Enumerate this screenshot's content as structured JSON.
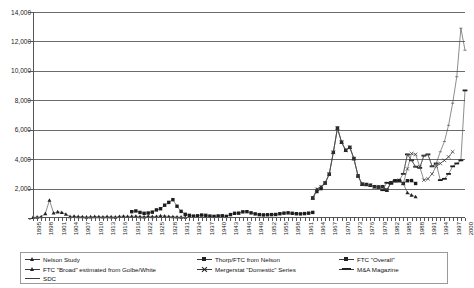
{
  "chart_data": {
    "type": "line",
    "title": "",
    "xlabel": "",
    "ylabel": "",
    "ylim": [
      0,
      14000
    ],
    "ytick_step": 2000,
    "ytick_labels": [
      "14,000",
      "12,000",
      "10,000",
      "8,000",
      "6,000",
      "4,000",
      "2,000",
      "-"
    ],
    "ytick_values": [
      14000,
      12000,
      10000,
      8000,
      6000,
      4000,
      2000,
      0
    ],
    "grid": "horizontal",
    "legend_position": "bottom",
    "x_start": 1895,
    "x_end": 2000,
    "x_label_step": 3,
    "xtick_labels": [
      "1895",
      "1898",
      "1901",
      "1904",
      "1907",
      "1910",
      "1913",
      "1916",
      "1919",
      "1922",
      "1925",
      "1928",
      "1931",
      "1934",
      "1937",
      "1940",
      "1943",
      "1946",
      "1949",
      "1952",
      "1955",
      "1958",
      "1961",
      "1964",
      "1967",
      "1970",
      "1973",
      "1976",
      "1979",
      "1982",
      "1985",
      "1988",
      "1991",
      "1994",
      "1997",
      "2000"
    ],
    "series": [
      {
        "name": "Nelson Study",
        "marker": "triangle",
        "x_start": 1895,
        "values": [
          40,
          60,
          90,
          300,
          1210,
          340,
          420,
          380,
          260,
          100,
          120,
          95,
          90,
          60,
          80,
          100,
          90,
          75,
          95,
          80,
          60,
          110,
          125,
          105,
          115,
          120,
          95,
          80,
          120,
          100,
          110,
          150,
          130,
          110,
          90,
          70,
          60,
          50
        ]
      },
      {
        "name": "Thorp/FTC from Nelson",
        "marker": "square",
        "x_start": 1919,
        "values": [
          430,
          480,
          380,
          320,
          340,
          400,
          550,
          630,
          870,
          1060,
          1245,
          800,
          450,
          250,
          180,
          130,
          150,
          200,
          180,
          130,
          110,
          140,
          150,
          110,
          230,
          320,
          330,
          420,
          430,
          350,
          280,
          230,
          210,
          220,
          230,
          240,
          290,
          330,
          350,
          320,
          290,
          280,
          300,
          330,
          380
        ]
      },
      {
        "name": "FTC \"Overall\"",
        "marker": "square",
        "x_start": 1963,
        "values": [
          1360,
          1800,
          2000,
          2380,
          2980,
          4460,
          6110,
          5150,
          4600,
          4800,
          4040,
          2860,
          2300,
          2276,
          2224,
          2128,
          2106,
          2128,
          1889,
          2395,
          2533,
          2543,
          2346,
          2533,
          2543,
          2346
        ]
      },
      {
        "name": "FTC \"Broad\" estimated from Golbe/White",
        "marker": "triangle",
        "x_start": 1963,
        "values": [
          1361,
          1950,
          2125,
          2377,
          2975,
          4462,
          6107,
          5152,
          4608,
          4801,
          4040,
          2861,
          2297,
          2276,
          2224,
          2128,
          2106,
          2128,
          1889,
          2395,
          2533,
          2543,
          2346,
          1719,
          1558,
          1450
        ]
      },
      {
        "name": "Mergerstat \"Domestic\" Series",
        "marker": "x",
        "x_start": 1963,
        "values": [
          1361,
          1950,
          2125,
          2377,
          2975,
          4462,
          6107,
          5152,
          4608,
          4801,
          4040,
          2861,
          2297,
          2276,
          2224,
          2128,
          2106,
          2128,
          1889,
          2395,
          2533,
          2543,
          2346,
          3336,
          4381,
          4323,
          3482,
          2574,
          2663,
          2997,
          3510,
          3705,
          3918,
          4152,
          4500
        ]
      },
      {
        "name": "M&A Magazine",
        "marker": "bar",
        "x_start": 1980,
        "values": [
          1889,
          2395,
          2346,
          2533,
          2543,
          3001,
          4323,
          3920,
          3487,
          3415,
          4239,
          4322,
          3510,
          3705,
          2574,
          2663,
          2997,
          3510,
          3705,
          3918,
          8670,
          7500
        ]
      },
      {
        "name": "SDC",
        "marker": "dash",
        "x_start": 1985,
        "values": [
          3001,
          4323,
          3920,
          3487,
          3415,
          4239,
          4322,
          3510,
          3705,
          4500,
          5200,
          6300,
          7800,
          9600,
          12900,
          11400
        ]
      }
    ]
  },
  "legend": {
    "columns": [
      {
        "items": [
          {
            "label": "Nelson Study",
            "marker": "triangle"
          },
          {
            "label": "FTC \"Broad\" estimated from Golbe/White",
            "marker": "triangle"
          },
          {
            "label": "SDC",
            "marker": "dash"
          }
        ]
      },
      {
        "items": [
          {
            "label": "Thorp/FTC from Nelson",
            "marker": "square"
          },
          {
            "label": "Mergerstat \"Domestic\" Series",
            "marker": "x"
          }
        ]
      },
      {
        "items": [
          {
            "label": "FTC \"Overall\"",
            "marker": "square"
          },
          {
            "label": "M&A Magazine",
            "marker": "bar"
          }
        ]
      }
    ]
  }
}
